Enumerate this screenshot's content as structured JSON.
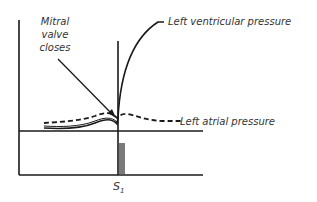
{
  "diagram": {
    "labels": {
      "mitral_line1": "Mitral",
      "mitral_line2": "valve",
      "mitral_line3": "closes",
      "lv_pressure": "Left ventricular pressure",
      "la_pressure": "Left atrial pressure",
      "s1_main": "S",
      "s1_sub": "1"
    },
    "colors": {
      "line": "#1a1a1a",
      "text": "#333333",
      "sound_bar": "#7a7a7a"
    }
  }
}
